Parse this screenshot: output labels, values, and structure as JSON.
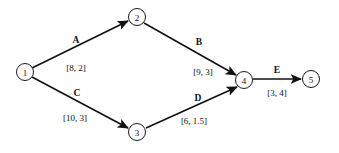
{
  "diagram": {
    "type": "directed-network-graph",
    "background_color": "#ffffff",
    "line_color": "#111111",
    "node_fill": "#ffffff",
    "nodes": [
      {
        "id": "1",
        "label": "1",
        "cx": 25,
        "cy": 72,
        "r": 8.5
      },
      {
        "id": "2",
        "label": "2",
        "cx": 137,
        "cy": 17,
        "r": 8.5
      },
      {
        "id": "3",
        "label": "3",
        "cx": 137,
        "cy": 132,
        "r": 8.5
      },
      {
        "id": "4",
        "label": "4",
        "cx": 244,
        "cy": 80,
        "r": 8.5
      },
      {
        "id": "5",
        "label": "5",
        "cx": 311,
        "cy": 79,
        "r": 8.5
      }
    ],
    "edges": [
      {
        "id": "edge-a",
        "name": "A",
        "weight": "[8, 2]",
        "from": "1",
        "to": "2",
        "x1": 32,
        "y1": 68,
        "x2": 128,
        "y2": 21,
        "name_x": 76,
        "name_y": 43,
        "weight_x": 76,
        "weight_y": 71
      },
      {
        "id": "edge-b",
        "name": "B",
        "weight": "[9, 3]",
        "from": "2",
        "to": "4",
        "x1": 144,
        "y1": 23,
        "x2": 236,
        "y2": 75,
        "name_x": 199,
        "name_y": 45,
        "weight_x": 203,
        "weight_y": 75
      },
      {
        "id": "edge-c",
        "name": "C",
        "weight": "[10, 3]",
        "from": "1",
        "to": "3",
        "x1": 32,
        "y1": 77,
        "x2": 128,
        "y2": 128,
        "name_x": 77,
        "name_y": 96,
        "weight_x": 75,
        "weight_y": 121
      },
      {
        "id": "edge-d",
        "name": "D",
        "weight": "[6, 1.5]",
        "from": "3",
        "to": "4",
        "x1": 146,
        "y1": 128,
        "x2": 237,
        "y2": 87,
        "name_x": 198,
        "name_y": 101,
        "weight_x": 194,
        "weight_y": 124
      },
      {
        "id": "edge-e",
        "name": "E",
        "weight": "[3, 4]",
        "from": "4",
        "to": "5",
        "x1": 253,
        "y1": 79,
        "x2": 301,
        "y2": 79,
        "name_x": 277,
        "name_y": 73,
        "weight_x": 277,
        "weight_y": 96
      }
    ]
  }
}
